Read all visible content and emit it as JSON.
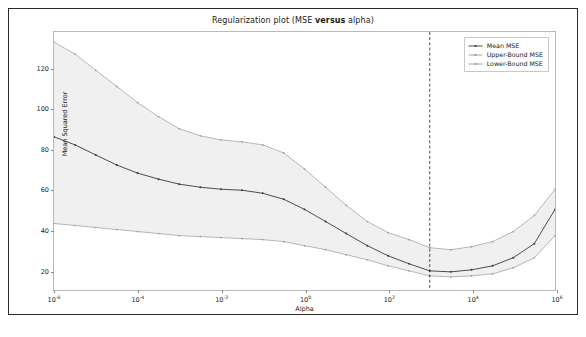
{
  "chart_data": {
    "type": "line",
    "title": "Regularization plot (MSE versus alpha)",
    "title_plain": "Regularization plot (MSE ",
    "title_bold": "versus",
    "title_tail": " alpha)",
    "xlabel": "Alpha",
    "ylabel": "Mean Squared Error",
    "xscale": "log",
    "yscale": "linear",
    "grid": false,
    "legend_position": "upper right",
    "xlim": [
      1e-06,
      1000000.0
    ],
    "ylim": [
      10,
      138
    ],
    "yticks": [
      20,
      40,
      60,
      80,
      100,
      120
    ],
    "ytick_labels": [
      "20",
      "40",
      "60",
      "80",
      "100",
      "120"
    ],
    "xticks": [
      1e-06,
      0.0001,
      0.01,
      1,
      100,
      10000,
      1000000
    ],
    "xtick_labels": [
      "10-6",
      "10-4",
      "10-2",
      "100",
      "102",
      "104",
      "106"
    ],
    "xtick_mantissa": "10",
    "xtick_exponents": [
      "-6",
      "-4",
      "-2",
      "0",
      "2",
      "4",
      "6"
    ],
    "annotations": [
      {
        "name": "best-alpha-vline",
        "type": "vline",
        "x": 1000,
        "style": "dashed",
        "color": "#222222",
        "label": ""
      }
    ],
    "x": [
      1e-06,
      3.2e-06,
      1e-05,
      3.2e-05,
      0.0001,
      0.00032,
      0.001,
      0.0032,
      0.01,
      0.032,
      0.1,
      0.32,
      1,
      3.2,
      10,
      32,
      100,
      320,
      1000,
      3200,
      10000,
      32000,
      100000,
      320000,
      1000000
    ],
    "series": [
      {
        "name": "Upper-Bound MSE",
        "label": "Upper-Bound MSE",
        "color": "#9a9a9a",
        "linestyle": "solid",
        "marker": "dot",
        "values": [
          133.0,
          127.0,
          119.0,
          111.0,
          103.0,
          96.0,
          90.0,
          86.5,
          84.5,
          83.5,
          82.0,
          78.0,
          70.0,
          61.0,
          52.0,
          44.0,
          38.5,
          35.0,
          31.0,
          30.0,
          31.5,
          34.0,
          39.0,
          47.0,
          60.0
        ]
      },
      {
        "name": "Mean MSE",
        "label": "Mean MSE",
        "color": "#3a3a3a",
        "linestyle": "solid",
        "marker": "dot",
        "values": [
          86.0,
          82.0,
          77.0,
          72.0,
          68.0,
          65.0,
          62.5,
          61.0,
          60.0,
          59.5,
          58.0,
          55.0,
          50.0,
          44.0,
          38.0,
          32.0,
          27.0,
          23.0,
          19.5,
          19.0,
          20.0,
          22.0,
          26.0,
          33.0,
          50.0
        ]
      },
      {
        "name": "Lower-Bound MSE",
        "label": "Lower-Bound MSE",
        "color": "#9a9a9a",
        "linestyle": "solid",
        "marker": "dot",
        "values": [
          43.0,
          42.0,
          41.0,
          40.0,
          39.0,
          38.0,
          37.0,
          36.5,
          36.0,
          35.5,
          35.0,
          34.0,
          32.0,
          30.0,
          27.5,
          25.0,
          22.0,
          19.5,
          17.0,
          16.5,
          17.0,
          18.0,
          21.0,
          26.0,
          37.0
        ]
      }
    ],
    "band": {
      "name": "confidence-band",
      "upper_series": "Upper-Bound MSE",
      "lower_series": "Lower-Bound MSE",
      "fill_color": "#f0f0f0"
    }
  },
  "legend": {
    "items": [
      {
        "label": "Mean MSE",
        "color": "#3a3a3a"
      },
      {
        "label": "Upper-Bound MSE",
        "color": "#9a9a9a"
      },
      {
        "label": "Lower-Bound MSE",
        "color": "#9a9a9a"
      }
    ]
  }
}
